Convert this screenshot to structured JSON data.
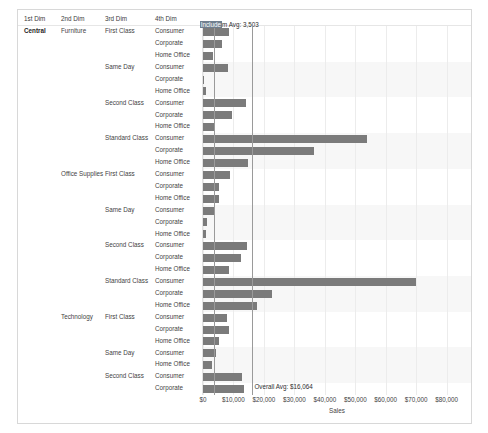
{
  "headers": [
    {
      "key": "h1",
      "label": "1st Dim"
    },
    {
      "key": "h2",
      "label": "2nd Dim"
    },
    {
      "key": "h3",
      "label": "3rd Dim"
    },
    {
      "key": "h4",
      "label": "4th Dim"
    }
  ],
  "reference_lines": [
    {
      "name": "dim-avg",
      "label": "Dim Avg: 3,503",
      "badge": "Include",
      "value": 3503
    },
    {
      "name": "overall-avg",
      "label": "Overall Avg: $16,064",
      "value": 16064
    }
  ],
  "axis": {
    "title": "Sales",
    "ticks": [
      "$0",
      "$10,000",
      "$20,000",
      "$30,000",
      "$40,000",
      "$50,000",
      "$60,000",
      "$70,000",
      "$80,000"
    ],
    "tick_values": [
      0,
      10000,
      20000,
      30000,
      40000,
      50000,
      60000,
      70000,
      80000
    ],
    "min": 0,
    "max": 80000
  },
  "colors": {
    "bar": "#7b7b7b",
    "grid": "#ececec",
    "refline": "#9a9a9a",
    "badge": "#6f7f8f",
    "band": "#f7f7f7",
    "text": "#3f3f3f"
  },
  "chart_data": {
    "type": "bar",
    "title": "",
    "xlabel": "Sales",
    "ylabel": "",
    "xlim": [
      0,
      80000
    ],
    "grid": true,
    "legend": false,
    "orientation": "horizontal",
    "dimensions": [
      "1st Dim",
      "2nd Dim",
      "3rd Dim",
      "4th Dim"
    ],
    "rows": [
      {
        "d1": "Central",
        "d2": "Furniture",
        "d3": "First Class",
        "d4": "Consumer",
        "value": 8500
      },
      {
        "d1": "",
        "d2": "",
        "d3": "",
        "d4": "Corporate",
        "value": 6200
      },
      {
        "d1": "",
        "d2": "",
        "d3": "",
        "d4": "Home Office",
        "value": 3200
      },
      {
        "d1": "",
        "d2": "",
        "d3": "Same Day",
        "d4": "Consumer",
        "value": 8100
      },
      {
        "d1": "",
        "d2": "",
        "d3": "",
        "d4": "Corporate",
        "value": 120
      },
      {
        "d1": "",
        "d2": "",
        "d3": "",
        "d4": "Home Office",
        "value": 900
      },
      {
        "d1": "",
        "d2": "",
        "d3": "Second Class",
        "d4": "Consumer",
        "value": 14200
      },
      {
        "d1": "",
        "d2": "",
        "d3": "",
        "d4": "Corporate",
        "value": 9600
      },
      {
        "d1": "",
        "d2": "",
        "d3": "",
        "d4": "Home Office",
        "value": 4100
      },
      {
        "d1": "",
        "d2": "",
        "d3": "Standard Class",
        "d4": "Consumer",
        "value": 54000
      },
      {
        "d1": "",
        "d2": "",
        "d3": "",
        "d4": "Corporate",
        "value": 36500
      },
      {
        "d1": "",
        "d2": "",
        "d3": "",
        "d4": "Home Office",
        "value": 14800
      },
      {
        "d1": "",
        "d2": "Office Supplies",
        "d3": "First Class",
        "d4": "Consumer",
        "value": 8900
      },
      {
        "d1": "",
        "d2": "",
        "d3": "",
        "d4": "Corporate",
        "value": 5400
      },
      {
        "d1": "",
        "d2": "",
        "d3": "",
        "d4": "Home Office",
        "value": 5200
      },
      {
        "d1": "",
        "d2": "",
        "d3": "Same Day",
        "d4": "Consumer",
        "value": 3700
      },
      {
        "d1": "",
        "d2": "",
        "d3": "",
        "d4": "Corporate",
        "value": 1300
      },
      {
        "d1": "",
        "d2": "",
        "d3": "",
        "d4": "Home Office",
        "value": 900
      },
      {
        "d1": "",
        "d2": "",
        "d3": "Second Class",
        "d4": "Consumer",
        "value": 14500
      },
      {
        "d1": "",
        "d2": "",
        "d3": "",
        "d4": "Corporate",
        "value": 12400
      },
      {
        "d1": "",
        "d2": "",
        "d3": "",
        "d4": "Home Office",
        "value": 8700
      },
      {
        "d1": "",
        "d2": "",
        "d3": "Standard Class",
        "d4": "Consumer",
        "value": 70000
      },
      {
        "d1": "",
        "d2": "",
        "d3": "",
        "d4": "Corporate",
        "value": 22500
      },
      {
        "d1": "",
        "d2": "",
        "d3": "",
        "d4": "Home Office",
        "value": 17700
      },
      {
        "d1": "",
        "d2": "Technology",
        "d3": "First Class",
        "d4": "Consumer",
        "value": 7900
      },
      {
        "d1": "",
        "d2": "",
        "d3": "",
        "d4": "Corporate",
        "value": 8700
      },
      {
        "d1": "",
        "d2": "",
        "d3": "",
        "d4": "Home Office",
        "value": 5100
      },
      {
        "d1": "",
        "d2": "",
        "d3": "Same Day",
        "d4": "Consumer",
        "value": 4300
      },
      {
        "d1": "",
        "d2": "",
        "d3": "",
        "d4": "Home Office",
        "value": 3100
      },
      {
        "d1": "",
        "d2": "",
        "d3": "Second Class",
        "d4": "Consumer",
        "value": 12700
      },
      {
        "d1": "",
        "d2": "",
        "d3": "",
        "d4": "Corporate",
        "value": 13300
      }
    ]
  }
}
